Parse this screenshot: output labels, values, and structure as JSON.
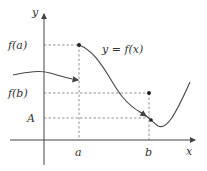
{
  "diagram": {
    "axes": {
      "x_label": "x",
      "y_label": "y"
    },
    "curve_label": "y = f(x)",
    "y_ticks": [
      {
        "label": "f(a)",
        "y": 45
      },
      {
        "label": "f(b)",
        "y": 93
      },
      {
        "label": "A",
        "y": 118
      }
    ],
    "x_ticks": [
      {
        "label": "a",
        "x": 79
      },
      {
        "label": "b",
        "x": 149
      }
    ],
    "points": [
      {
        "name": "point-a-fa",
        "x": 79,
        "y": 45,
        "filled": true
      },
      {
        "name": "point-b-fb",
        "x": 149,
        "y": 93,
        "filled": true
      }
    ],
    "colors": {
      "stroke": "#444444",
      "dashed": "#777777"
    }
  }
}
